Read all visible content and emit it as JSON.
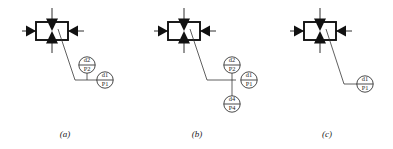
{
  "figure": {
    "background_color": "#ffffff",
    "line_color": "#1a1a1a",
    "fill_color": "#111111",
    "panel_count": 3
  },
  "panels": [
    {
      "id": "panel-a",
      "caption": "(a)",
      "symbol": {
        "name": "datum-target-box",
        "description": "rectangle with four inward solid triangular arrowheads",
        "arrow_count": 4
      },
      "targets": [
        {
          "id": "target-a-top",
          "upper": "d2",
          "lower": "P2",
          "position": "upper"
        },
        {
          "id": "target-a-right",
          "upper": "d1",
          "lower": "P1",
          "position": "right"
        }
      ]
    },
    {
      "id": "panel-b",
      "caption": "(b)",
      "symbol": {
        "name": "datum-target-box",
        "description": "rectangle with four inward solid triangular arrowheads",
        "arrow_count": 4
      },
      "targets": [
        {
          "id": "target-b-top",
          "upper": "d2",
          "lower": "P2",
          "position": "upper"
        },
        {
          "id": "target-b-right",
          "upper": "d1",
          "lower": "P1",
          "position": "right"
        },
        {
          "id": "target-b-bottom",
          "upper": "d4",
          "lower": "P4",
          "position": "lower"
        }
      ]
    },
    {
      "id": "panel-c",
      "caption": "(c)",
      "symbol": {
        "name": "datum-target-box",
        "description": "rectangle with four inward solid triangular arrowheads",
        "arrow_count": 4
      },
      "targets": [
        {
          "id": "target-c-right",
          "upper": "d1",
          "lower": "P1",
          "position": "right"
        }
      ]
    }
  ]
}
